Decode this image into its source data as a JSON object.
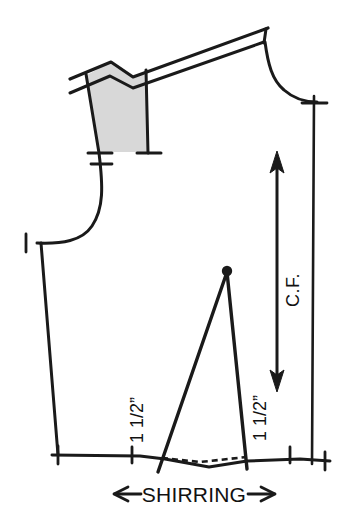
{
  "diagram": {
    "type": "sewing-pattern-technical-drawing",
    "background_color": "#ffffff",
    "ink_color": "#1a1a1a",
    "shaded_fill_color": "#d8d8d8",
    "labels": {
      "shirring": "SHIRRING",
      "shirring_left_arrow": "←",
      "shirring_right_arrow": "→",
      "measure_left": "1 1/2”",
      "measure_right": "1 1/2”",
      "center_front": "C.F."
    },
    "annotations": [
      {
        "name": "shaded-facing-panel",
        "description": "gray shaded quadrilateral panel at upper left (shoulder facing / strap section)"
      },
      {
        "name": "shoulder-strap",
        "description": "double parallel lines forming shoulder strap running up to the right"
      },
      {
        "name": "neckline-curve",
        "description": "concave curve from shoulder down to center front line"
      },
      {
        "name": "armhole-curve",
        "description": "S-curve at left forming the armhole"
      },
      {
        "name": "side-seam",
        "description": "long nearly vertical left edge slanting outward to the hem"
      },
      {
        "name": "hem-line",
        "description": "horizontal bottom edge with notches"
      },
      {
        "name": "hem-dashed-line",
        "description": "dashed stitching line dipping between the dart legs"
      },
      {
        "name": "waist-dart",
        "description": "tall narrow triangular dart with filled apex dot"
      },
      {
        "name": "grainline-arrow",
        "description": "vertical double-headed arrow indicating grain / center front direction"
      },
      {
        "name": "center-front-line",
        "description": "straight vertical line at right edge marked C.F."
      },
      {
        "name": "notch-marks",
        "description": "short crossing tick marks along seam lines"
      }
    ]
  }
}
